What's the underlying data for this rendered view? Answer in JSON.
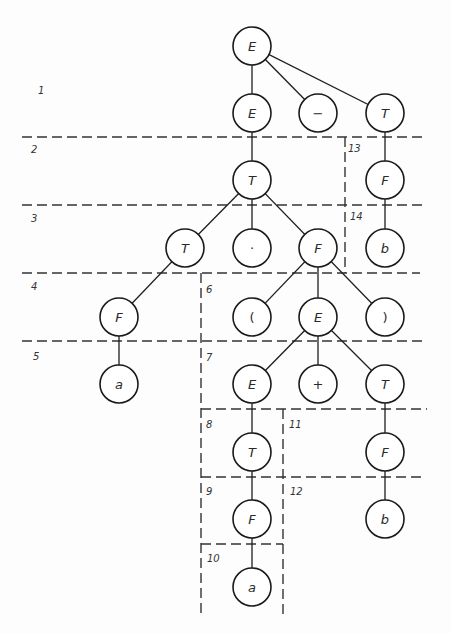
{
  "diagram": {
    "type": "parse-tree",
    "node_radius": 19,
    "nodes": [
      {
        "id": "n1",
        "label": "E",
        "x": 252,
        "y": 46,
        "kind": "symbol"
      },
      {
        "id": "n2",
        "label": "E",
        "x": 252,
        "y": 113,
        "kind": "symbol"
      },
      {
        "id": "n3",
        "label": "−",
        "x": 318,
        "y": 113,
        "kind": "operator"
      },
      {
        "id": "n4",
        "label": "T",
        "x": 385,
        "y": 113,
        "kind": "symbol"
      },
      {
        "id": "n5",
        "label": "T",
        "x": 252,
        "y": 180,
        "kind": "symbol"
      },
      {
        "id": "n6",
        "label": "F",
        "x": 385,
        "y": 180,
        "kind": "symbol"
      },
      {
        "id": "n7",
        "label": "T",
        "x": 185,
        "y": 248,
        "kind": "symbol"
      },
      {
        "id": "n8",
        "label": "·",
        "x": 252,
        "y": 248,
        "kind": "operator"
      },
      {
        "id": "n9",
        "label": "F",
        "x": 318,
        "y": 248,
        "kind": "symbol"
      },
      {
        "id": "n10",
        "label": "b",
        "x": 385,
        "y": 248,
        "kind": "terminal"
      },
      {
        "id": "n11",
        "label": "F",
        "x": 119,
        "y": 317,
        "kind": "symbol"
      },
      {
        "id": "n12",
        "label": "(",
        "x": 252,
        "y": 317,
        "kind": "operator"
      },
      {
        "id": "n13",
        "label": "E",
        "x": 318,
        "y": 317,
        "kind": "symbol"
      },
      {
        "id": "n14",
        "label": ")",
        "x": 385,
        "y": 317,
        "kind": "operator"
      },
      {
        "id": "n15",
        "label": "a",
        "x": 119,
        "y": 384,
        "kind": "terminal"
      },
      {
        "id": "n16",
        "label": "E",
        "x": 252,
        "y": 384,
        "kind": "symbol"
      },
      {
        "id": "n17",
        "label": "+",
        "x": 318,
        "y": 384,
        "kind": "operator"
      },
      {
        "id": "n18",
        "label": "T",
        "x": 385,
        "y": 384,
        "kind": "symbol"
      },
      {
        "id": "n19",
        "label": "T",
        "x": 252,
        "y": 452,
        "kind": "symbol"
      },
      {
        "id": "n20",
        "label": "F",
        "x": 385,
        "y": 452,
        "kind": "symbol"
      },
      {
        "id": "n21",
        "label": "F",
        "x": 252,
        "y": 519,
        "kind": "symbol"
      },
      {
        "id": "n22",
        "label": "b",
        "x": 385,
        "y": 519,
        "kind": "terminal"
      },
      {
        "id": "n23",
        "label": "a",
        "x": 252,
        "y": 587,
        "kind": "terminal"
      }
    ],
    "edges": [
      [
        "n1",
        "n2"
      ],
      [
        "n1",
        "n3"
      ],
      [
        "n1",
        "n4"
      ],
      [
        "n2",
        "n5"
      ],
      [
        "n4",
        "n6"
      ],
      [
        "n5",
        "n7"
      ],
      [
        "n5",
        "n8"
      ],
      [
        "n5",
        "n9"
      ],
      [
        "n6",
        "n10"
      ],
      [
        "n7",
        "n11"
      ],
      [
        "n9",
        "n12"
      ],
      [
        "n9",
        "n13"
      ],
      [
        "n9",
        "n14"
      ],
      [
        "n11",
        "n15"
      ],
      [
        "n13",
        "n16"
      ],
      [
        "n13",
        "n17"
      ],
      [
        "n13",
        "n18"
      ],
      [
        "n16",
        "n19"
      ],
      [
        "n18",
        "n20"
      ],
      [
        "n19",
        "n21"
      ],
      [
        "n20",
        "n22"
      ],
      [
        "n21",
        "n23"
      ]
    ],
    "dashed_lines": [
      {
        "x1": 22,
        "y1": 137,
        "x2": 427,
        "y2": 137
      },
      {
        "x1": 22,
        "y1": 205,
        "x2": 426,
        "y2": 205
      },
      {
        "x1": 22,
        "y1": 273,
        "x2": 420,
        "y2": 273
      },
      {
        "x1": 22,
        "y1": 341,
        "x2": 427,
        "y2": 341
      },
      {
        "x1": 201,
        "y1": 409,
        "x2": 427,
        "y2": 409
      },
      {
        "x1": 201,
        "y1": 477,
        "x2": 423,
        "y2": 477
      },
      {
        "x1": 201,
        "y1": 544,
        "x2": 283,
        "y2": 544
      },
      {
        "x1": 345,
        "y1": 137,
        "x2": 345,
        "y2": 273
      },
      {
        "x1": 201,
        "y1": 273,
        "x2": 201,
        "y2": 615
      },
      {
        "x1": 283,
        "y1": 409,
        "x2": 283,
        "y2": 615
      }
    ],
    "region_labels": [
      {
        "text": "1",
        "x": 38,
        "y": 94
      },
      {
        "text": "2",
        "x": 31,
        "y": 153
      },
      {
        "text": "3",
        "x": 31,
        "y": 222
      },
      {
        "text": "4",
        "x": 31,
        "y": 290
      },
      {
        "text": "5",
        "x": 33,
        "y": 360
      },
      {
        "text": "6",
        "x": 206,
        "y": 293
      },
      {
        "text": "7",
        "x": 206,
        "y": 361
      },
      {
        "text": "8",
        "x": 206,
        "y": 428
      },
      {
        "text": "9",
        "x": 206,
        "y": 495
      },
      {
        "text": "10",
        "x": 207,
        "y": 562
      },
      {
        "text": "11",
        "x": 289,
        "y": 428
      },
      {
        "text": "12",
        "x": 290,
        "y": 495
      },
      {
        "text": "13",
        "x": 348,
        "y": 152
      },
      {
        "text": "14",
        "x": 350,
        "y": 220
      }
    ]
  }
}
